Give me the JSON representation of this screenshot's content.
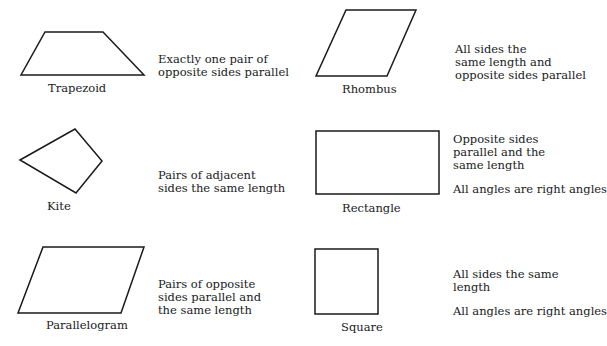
{
  "shapes": {
    "trapezoid": {
      "name": "Trapezoid",
      "description": [
        "Exactly one pair of",
        "opposite sides parallel"
      ],
      "points": "45,32 103,32 144,75 21,75"
    },
    "rhombus": {
      "name": "Rhombus",
      "description": [
        "All sides the",
        "same length and",
        "opposite sides parallel"
      ],
      "points": "346,10 416,10 387,76 316,76"
    },
    "kite": {
      "name": "Kite",
      "description": [
        "Pairs of adjacent",
        "sides the same length"
      ],
      "points": "20,160 75,129 102,161 76,193"
    },
    "rectangle": {
      "name": "Rectangle",
      "description": [
        "Opposite sides",
        "parallel and the",
        "same length"
      ],
      "note": "All angles are right angles",
      "points": "316,131 439,131 439,194 316,194"
    },
    "parallelogram": {
      "name": "Parallelogram",
      "description": [
        "Pairs of opposite",
        "sides parallel and",
        "the same length"
      ],
      "points": "43,247 144,247 121,313 18,313"
    },
    "square": {
      "name": "Square",
      "description": [
        "All sides the same",
        "length"
      ],
      "note": "All angles are right angles",
      "points": "315,249 378,249 378,314 315,314"
    }
  },
  "colors": {
    "stroke": "#1a1a1a",
    "background": "#ffffff"
  }
}
